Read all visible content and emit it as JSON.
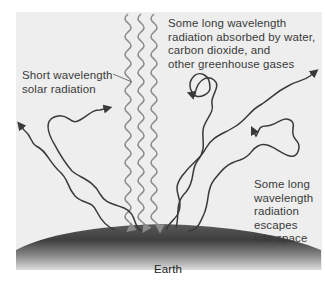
{
  "diagram": {
    "type": "greenhouse-effect",
    "background_color": "#eeeeee",
    "solar_wave_color": "#8a8a8a",
    "longwave_color": "#3a3a3a",
    "labels": {
      "absorbed": [
        "Some long wavelength",
        "radiation absorbed by water,",
        "carbon dioxide, and",
        "other greenhouse gases"
      ],
      "short_wave": [
        "Short wavelength",
        "solar radiation"
      ],
      "escapes": [
        "Some long",
        "wavelength",
        "radiation",
        "escapes",
        "into space"
      ],
      "earth": "Earth"
    }
  }
}
